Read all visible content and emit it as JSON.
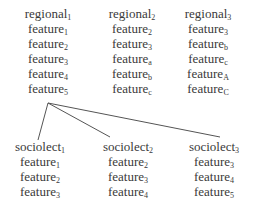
{
  "regionals": [
    {
      "base": "regional",
      "sub": "1",
      "features": [
        {
          "base": "feature",
          "sub": "1"
        },
        {
          "base": "feature",
          "sub": "2"
        },
        {
          "base": "feature",
          "sub": "3"
        },
        {
          "base": "feature",
          "sub": "4"
        },
        {
          "base": "feature",
          "sub": "5"
        }
      ]
    },
    {
      "base": "regional",
      "sub": "2",
      "features": [
        {
          "base": "feature",
          "sub": "2"
        },
        {
          "base": "feature",
          "sub": "3"
        },
        {
          "base": "feature",
          "sub": "a"
        },
        {
          "base": "feature",
          "sub": "b"
        },
        {
          "base": "feature",
          "sub": "c"
        }
      ]
    },
    {
      "base": "regional",
      "sub": "3",
      "features": [
        {
          "base": "feature",
          "sub": "3"
        },
        {
          "base": "feature",
          "sub": "b"
        },
        {
          "base": "feature",
          "sub": "c"
        },
        {
          "base": "feature",
          "sub": "A"
        },
        {
          "base": "feature",
          "sub": "C"
        }
      ]
    }
  ],
  "sociolects": [
    {
      "base": "sociolect",
      "sub": "1",
      "features": [
        {
          "base": "feature",
          "sub": "1"
        },
        {
          "base": "feature",
          "sub": "2"
        },
        {
          "base": "feature",
          "sub": "3"
        }
      ]
    },
    {
      "base": "sociolect",
      "sub": "2",
      "features": [
        {
          "base": "feature",
          "sub": "2"
        },
        {
          "base": "feature",
          "sub": "3"
        },
        {
          "base": "feature",
          "sub": "4"
        }
      ]
    },
    {
      "base": "sociolect",
      "sub": "3",
      "features": [
        {
          "base": "feature",
          "sub": "3"
        },
        {
          "base": "feature",
          "sub": "4"
        },
        {
          "base": "feature",
          "sub": "5"
        }
      ]
    }
  ],
  "links": {
    "from": "regional_1.feature_5",
    "to": [
      "sociolect_1",
      "sociolect_2",
      "sociolect_3"
    ]
  },
  "colors": {
    "text": "#3a3a3a",
    "line": "#555555"
  }
}
